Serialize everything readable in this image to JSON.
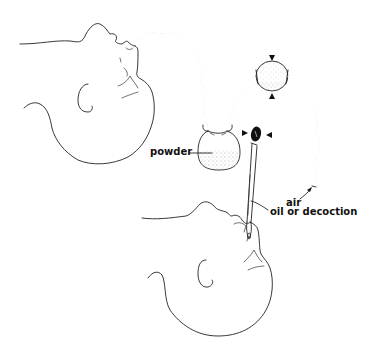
{
  "diagram": {
    "labels": {
      "powder": "powder",
      "air": "air",
      "oil_or_decoction": "oil or decoction"
    },
    "components": [
      {
        "id": "infant-head-top",
        "description": "Infant head, upside down, receiving powder via nasal tube"
      },
      {
        "id": "nasal-tube",
        "description": "Tube from infant nostril to powder container"
      },
      {
        "id": "powder-container",
        "description": "Stippled container holding powder"
      },
      {
        "id": "squeeze-bulb",
        "description": "Rubber bulb compressed (arrows) to push air"
      },
      {
        "id": "air-inlet-tube",
        "description": "Open tube end where air enters"
      },
      {
        "id": "dropper",
        "description": "Dropper with squeezed bulb (arrows) delivering oil or decoction"
      },
      {
        "id": "infant-head-bottom",
        "description": "Infant head receiving drops in nostril"
      }
    ],
    "colors": {
      "line": "#222222",
      "background": "#ffffff",
      "stipple": "#555555",
      "dropper_bulb": "#111111"
    }
  }
}
